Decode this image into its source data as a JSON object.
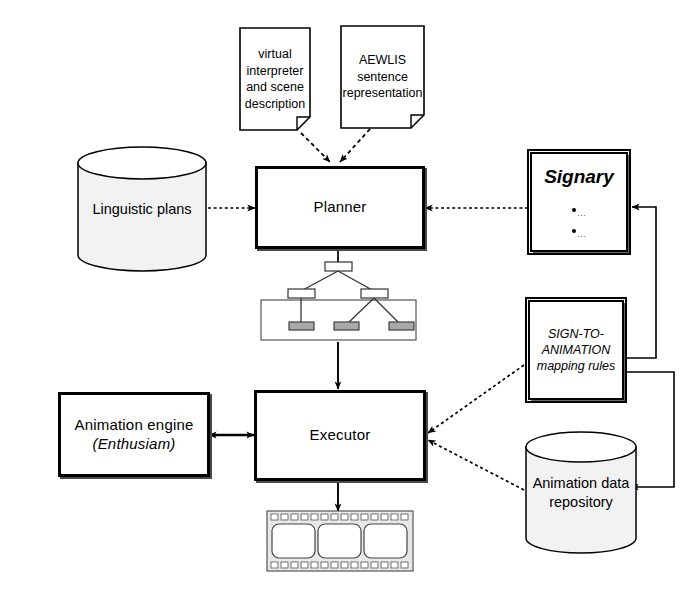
{
  "diagram": {
    "colors": {
      "stroke": "#000000",
      "fill": "#ffffff",
      "shadow": "#6a6a6a",
      "cylinder_fill": "#f2f2f2",
      "leaf_fill": "#a8a8a8",
      "film_fill": "#e8e8e8"
    },
    "nodes": {
      "doc_virtual": {
        "name": "virtual-interpreter-document",
        "lines": [
          "virtual",
          "interpreter",
          "and",
          "scene",
          "description"
        ],
        "text": "virtual interpreter and scene description",
        "shape": "document"
      },
      "doc_aewlis": {
        "name": "aewlis-document",
        "lines": [
          "AEWLIS",
          "sentence",
          "representation"
        ],
        "text": "AEWLIS sentence representation",
        "shape": "document"
      },
      "linguistic_plans": {
        "name": "linguistic-plans-store",
        "lines": [
          "Linguistic",
          "plans"
        ],
        "text": "Linguistic plans",
        "shape": "cylinder"
      },
      "planner": {
        "name": "planner-process",
        "text": "Planner",
        "shape": "process"
      },
      "signary": {
        "name": "signary-store",
        "title": "Signary",
        "bullets": [
          "…",
          "…"
        ],
        "shape": "store"
      },
      "mapping_rules": {
        "name": "sign-to-animation-mapping-rules-store",
        "lines": [
          "SIGN-TO-",
          "ANIMATION",
          "mapping",
          "rules"
        ],
        "text": "SIGN-TO-ANIMATION mapping rules",
        "shape": "store"
      },
      "plan_tree": {
        "name": "plan-tree-artifact",
        "shape": "tree",
        "root_count": 1,
        "mid_count": 2,
        "leaf_count": 3
      },
      "executor": {
        "name": "executor-process",
        "text": "Executor",
        "shape": "process"
      },
      "animation_engine": {
        "name": "animation-engine-process",
        "line1": "Animation engine",
        "line2": "(Enthusiam)",
        "engine_name": "Enthusiam",
        "text": "Animation engine (Enthusiam)",
        "shape": "process"
      },
      "animation_repository": {
        "name": "animation-data-repository-store",
        "lines": [
          "Animation",
          "data",
          "repository"
        ],
        "text": "Animation data repository",
        "shape": "cylinder"
      },
      "film_strip": {
        "name": "film-strip-artifact",
        "shape": "film",
        "frames": 3
      }
    },
    "edges": [
      {
        "name": "edge-virtual-doc-to-planner",
        "from": "doc_virtual",
        "to": "planner",
        "style": "dashed",
        "arrow": "single"
      },
      {
        "name": "edge-aewlis-doc-to-planner",
        "from": "doc_aewlis",
        "to": "planner",
        "style": "dashed",
        "arrow": "single"
      },
      {
        "name": "edge-linguistic-plans-to-planner",
        "from": "linguistic_plans",
        "to": "planner",
        "style": "dashed",
        "arrow": "single"
      },
      {
        "name": "edge-signary-to-planner",
        "from": "signary",
        "to": "planner",
        "style": "dashed",
        "arrow": "single"
      },
      {
        "name": "edge-planner-to-plan-tree",
        "from": "planner",
        "to": "plan_tree",
        "style": "solid",
        "arrow": "none"
      },
      {
        "name": "edge-plan-tree-to-executor",
        "from": "plan_tree",
        "to": "executor",
        "style": "solid",
        "arrow": "single"
      },
      {
        "name": "edge-executor-to-animation-engine",
        "from": "executor",
        "to": "animation_engine",
        "style": "solid",
        "arrow": "double"
      },
      {
        "name": "edge-mapping-rules-to-executor",
        "from": "mapping_rules",
        "to": "executor",
        "style": "dashed",
        "arrow": "single"
      },
      {
        "name": "edge-repository-to-executor",
        "from": "animation_repository",
        "to": "executor",
        "style": "dashed",
        "arrow": "single"
      },
      {
        "name": "edge-mapping-rules-to-signary",
        "from": "mapping_rules",
        "to": "signary",
        "style": "solid",
        "arrow": "single"
      },
      {
        "name": "edge-mapping-rules-to-repository",
        "from": "mapping_rules",
        "to": "animation_repository",
        "style": "solid",
        "arrow": "single"
      },
      {
        "name": "edge-executor-to-film-strip",
        "from": "executor",
        "to": "film_strip",
        "style": "solid",
        "arrow": "single"
      }
    ]
  }
}
